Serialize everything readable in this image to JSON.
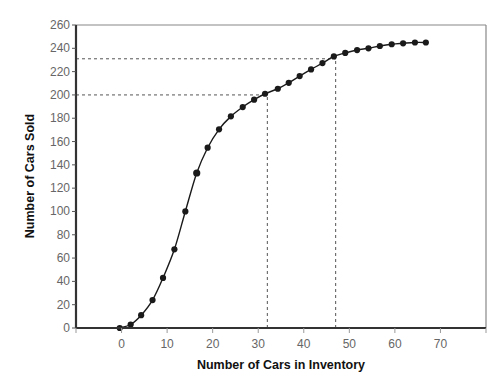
{
  "chart_data": {
    "type": "line",
    "title": "",
    "xlabel": "Number of Cars in Inventory",
    "ylabel": "Number of Cars Sold",
    "xlim": [
      -10,
      80
    ],
    "ylim": [
      0,
      260
    ],
    "x_ticks": [
      0,
      10,
      20,
      30,
      40,
      50,
      60,
      70
    ],
    "y_ticks": [
      0,
      20,
      40,
      60,
      80,
      100,
      120,
      140,
      160,
      180,
      200,
      220,
      240,
      260
    ],
    "grid": false,
    "legend": null,
    "series": [
      {
        "name": "Cars Sold",
        "marker": "circle",
        "color": "#1a1a1a",
        "x": [
          -0.4,
          2,
          4.3,
          6.8,
          9.1,
          11.6,
          14,
          16.5,
          18.9,
          21.4,
          24,
          26.6,
          29.1,
          31.5,
          34.3,
          36.7,
          39.1,
          41.6,
          44.1,
          46.6,
          49.1,
          51.7,
          54.2,
          56.7,
          59.3,
          61.8,
          64.4,
          66.8
        ],
        "y": [
          0,
          3,
          11,
          24,
          43,
          67.5,
          100,
          133,
          154.7,
          170.5,
          181.6,
          189.6,
          195.9,
          201,
          205.3,
          210.4,
          216.2,
          221.9,
          227.3,
          233,
          236,
          238.5,
          240,
          242,
          243.5,
          244.3,
          245,
          245
        ]
      }
    ],
    "annotations": [
      {
        "type": "hline-dashed",
        "y": 200,
        "x_end": 32
      },
      {
        "type": "vline-dashed",
        "x": 32,
        "y_end": 200
      },
      {
        "type": "hline-dashed",
        "y": 231,
        "x_end": 47
      },
      {
        "type": "vline-dashed",
        "x": 47,
        "y_end": 231
      }
    ]
  }
}
